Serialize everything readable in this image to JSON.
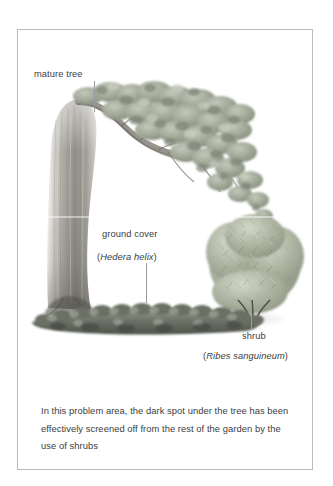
{
  "figure": {
    "labels": {
      "mature_tree": "mature tree",
      "ground_cover": "ground cover",
      "ground_cover_species_open": "(",
      "ground_cover_species": "Hedera helix",
      "ground_cover_species_close": ")",
      "shrub": "shrub",
      "shrub_species_open": "(",
      "shrub_species": "Ribes sanguineum",
      "shrub_species_close": ")"
    },
    "caption": "In this problem area, the dark spot under the tree has been effectively screened off from the rest of the garden by the use of shrubs",
    "colors": {
      "text": "#3b3d40",
      "border": "#b9bcbe",
      "leader_line": "#9a9da0",
      "foliage": "#9aa296",
      "trunk": "#8d8b84",
      "ground_cover": "#6d7068",
      "shrub": "#a9ae9f",
      "background": "#ffffff"
    },
    "scene": {
      "elements": [
        "mature-tree-trunk",
        "mature-tree-canopy",
        "ground-cover-bed",
        "shrub-mass",
        "ground-shadow"
      ]
    }
  }
}
